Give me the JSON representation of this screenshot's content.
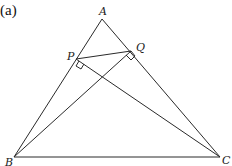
{
  "figure": {
    "tag": "(a)",
    "points": {
      "A": {
        "label": "A",
        "x": 102,
        "y": 19
      },
      "P": {
        "label": "P",
        "x": 76,
        "y": 59
      },
      "Q": {
        "label": "Q",
        "x": 131,
        "y": 51
      },
      "B": {
        "label": "B",
        "x": 14,
        "y": 157
      },
      "C": {
        "label": "C",
        "x": 220,
        "y": 157
      }
    },
    "segments": [
      [
        "A",
        "B"
      ],
      [
        "A",
        "C"
      ],
      [
        "B",
        "C"
      ],
      [
        "P",
        "Q"
      ],
      [
        "P",
        "C"
      ],
      [
        "Q",
        "B"
      ]
    ],
    "right_angles": [
      "P",
      "Q"
    ]
  }
}
